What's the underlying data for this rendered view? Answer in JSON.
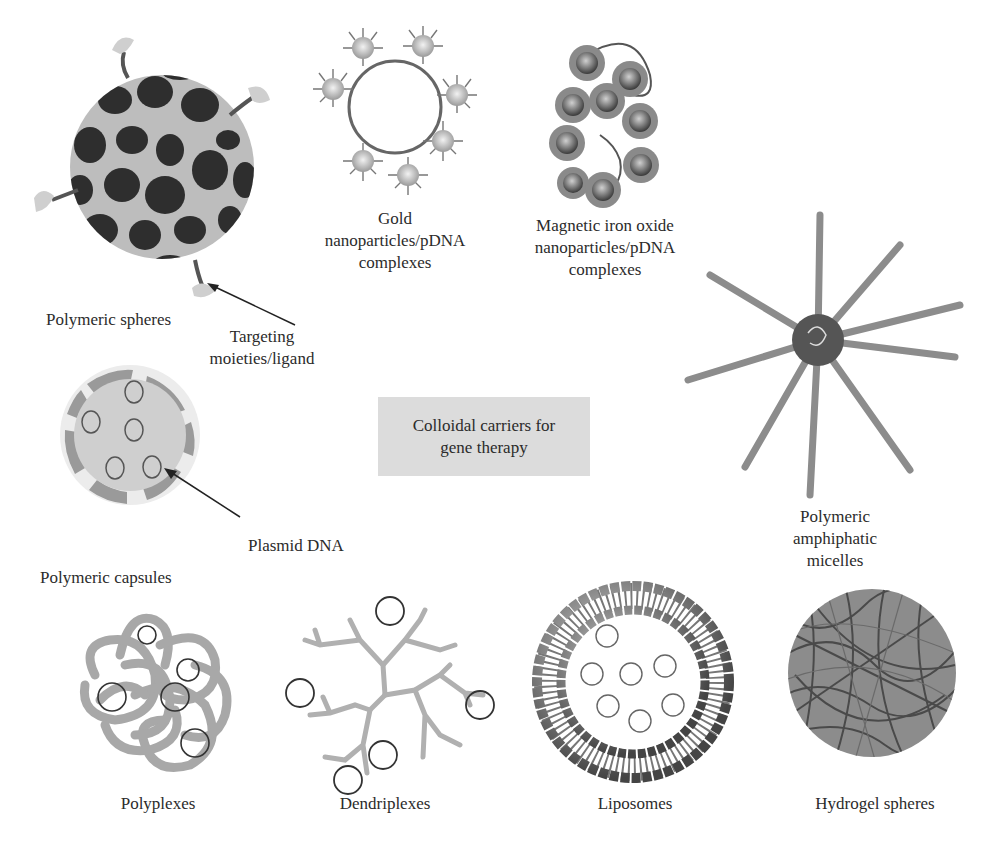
{
  "diagram": {
    "title": "Colloidal carriers for gene therapy",
    "title_lines": [
      "Colloidal carriers for",
      "gene therapy"
    ],
    "colors": {
      "background": "#ffffff",
      "center_box": "#dcdcdc",
      "dark_particle": "#2e2e2e",
      "light_gray": "#bdbdbd",
      "mid_gray": "#8a8a8a",
      "text": "#2b2b2b"
    },
    "carriers": [
      {
        "id": "polymeric-spheres",
        "label_lines": [
          "Polymeric spheres"
        ]
      },
      {
        "id": "gold-nanoparticles",
        "label_lines": [
          "Gold",
          "nanoparticles/pDNA",
          "complexes"
        ]
      },
      {
        "id": "magnetic-iron-oxide",
        "label_lines": [
          "Magnetic iron oxide",
          "nanoparticles/pDNA",
          "complexes"
        ]
      },
      {
        "id": "polymeric-micelles",
        "label_lines": [
          "Polymeric",
          "amphiphatic",
          "micelles"
        ]
      },
      {
        "id": "polymeric-capsules",
        "label_lines": [
          "Polymeric capsules"
        ]
      },
      {
        "id": "polyplexes",
        "label_lines": [
          "Polyplexes"
        ]
      },
      {
        "id": "dendriplexes",
        "label_lines": [
          "Dendriplexes"
        ]
      },
      {
        "id": "liposomes",
        "label_lines": [
          "Liposomes"
        ]
      },
      {
        "id": "hydrogel-spheres",
        "label_lines": [
          "Hydrogel spheres"
        ]
      }
    ],
    "annotations": [
      {
        "id": "targeting",
        "label_lines": [
          "Targeting",
          "moieties/ligand"
        ]
      },
      {
        "id": "plasmid",
        "label_lines": [
          "Plasmid DNA"
        ]
      }
    ]
  }
}
